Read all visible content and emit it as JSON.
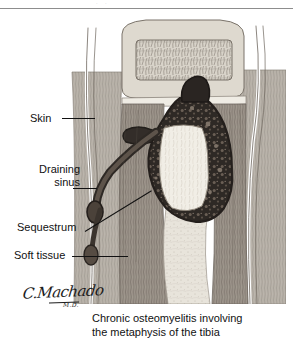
{
  "page": {
    "background_color": "#ffffff",
    "width": 293,
    "height": 342,
    "header_ghost_text": "·  ·"
  },
  "illustration": {
    "title": "cross-section of tibia with chronic osteomyelitis",
    "colors": {
      "soft_tissue": "#b9b3ab",
      "cortical_bone": "#8e877e",
      "marrow_pale": "#e6e2da",
      "abscess_dark": "#2f2a27",
      "sequestrum_pale": "#f2efe7",
      "outline": "#3a3530",
      "skin_line": "#ffffff"
    }
  },
  "labels": [
    {
      "id": "skin",
      "text": "Skin"
    },
    {
      "id": "sinus_l1",
      "text": "Draining"
    },
    {
      "id": "sinus_l2",
      "text": "sinus"
    },
    {
      "id": "sequestrum",
      "text": "Sequestrum"
    },
    {
      "id": "soft",
      "text": "Soft tissue"
    }
  ],
  "label_text": {
    "skin": "Skin",
    "draining": "Draining",
    "sinus": "sinus",
    "sequestrum": "Sequestrum",
    "soft_tissue": "Soft tissue"
  },
  "signature": {
    "name": "C.Machado",
    "credential": "M.D."
  },
  "caption": {
    "line1": "Chronic osteomyelitis involving",
    "line2": "the metaphysis of the tibia",
    "full": "Chronic osteomyelitis involving the metaphysis of the tibia"
  }
}
